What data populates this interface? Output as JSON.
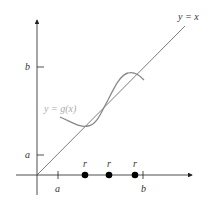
{
  "diagram": {
    "line_label": "y = x",
    "curve_label": "y = g(x)",
    "y_axis_ticks": [
      {
        "label": "b"
      },
      {
        "label": "a"
      }
    ],
    "x_axis_ticks": [
      {
        "label": "a"
      },
      {
        "label": "b"
      }
    ],
    "fixed_points": [
      {
        "label": "r"
      },
      {
        "label": "r"
      },
      {
        "label": "r"
      }
    ],
    "colors": {
      "axes": "#222222",
      "line": "#444444",
      "curve": "#888888",
      "points": "#000000"
    }
  }
}
